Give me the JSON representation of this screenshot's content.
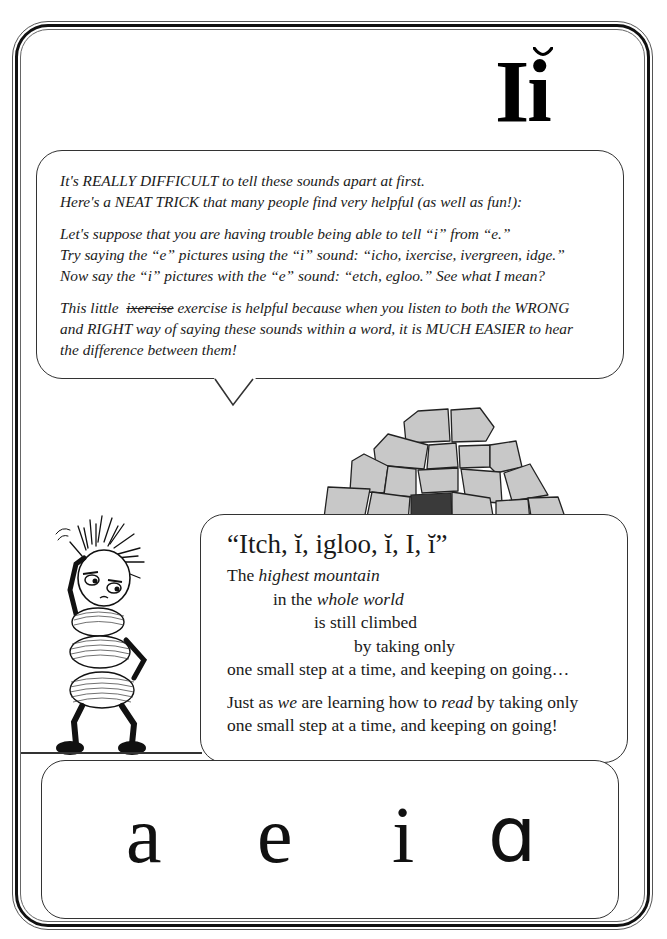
{
  "header": {
    "letter_upper": "I",
    "letter_lower": "i",
    "diacritic": "breve"
  },
  "intro_bubble": {
    "paragraphs": [
      {
        "lines": [
          "It's REALLY DIFFICULT to tell these sounds apart at first.",
          "Here's a NEAT TRICK that many people find very helpful (as well as fun!):"
        ]
      },
      {
        "lines": [
          "Let's suppose that you are having trouble being able to tell “i” from “e.”",
          "Try saying the “e” pictures using the “i” sound: “icho, ixercise, ivergreen, idge.”",
          "Now say the “i” pictures with the “e” sound: “etch, egloo.” See what I mean?"
        ]
      },
      {
        "line1_prefix": "This little ",
        "line1_struck": "ixercise",
        "line1_suffix": " exercise is helpful because when you listen to both the WRONG",
        "lines": [
          "and RIGHT way of saying these sounds within a word, it is MUCH EASIER to hear",
          "the difference between them!"
        ]
      }
    ]
  },
  "illustrations": {
    "igloo": "igloo-illustration",
    "character": "confused-bug-character"
  },
  "poem_bubble": {
    "chant": "“Itch, ĭ, igloo, ĭ, I, ĭ”",
    "poem": {
      "l1_a": "The ",
      "l1_b": "highest mountain",
      "l2_a": "in the ",
      "l2_b": "whole world",
      "l3": "is still climbed",
      "l4": "by taking only",
      "l5": "one small step at a time, and keeping on going…",
      "l6_a": "Just as ",
      "l6_b": "we",
      "l6_c": " are learning how to ",
      "l6_d": "read",
      "l6_e": " by taking only",
      "l7": "one small step at a time, and keeping on going!"
    }
  },
  "letters_box": {
    "letters": [
      "a",
      "e",
      "i",
      "ɑ"
    ]
  },
  "colors": {
    "ink": "#1a1a1a",
    "igloo_block": "#c8c8c8",
    "igloo_door": "#3a3a3a",
    "background": "#ffffff"
  }
}
